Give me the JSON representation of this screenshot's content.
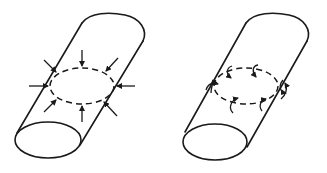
{
  "figure": {
    "panels": [
      {
        "id": "left",
        "description": "Cylinder with radial compressive arrows pointing inward toward a dashed circular section",
        "arrow_count": 8,
        "arrow_style": "radial-inward"
      },
      {
        "id": "right",
        "description": "Cylinder with curved arrows around a dashed circular section indicating circumferential shear/torsion",
        "arrow_count": 8,
        "arrow_style": "curved-tangential"
      }
    ],
    "colors": {
      "line": "#1a1a1a",
      "background": "#ffffff"
    }
  }
}
